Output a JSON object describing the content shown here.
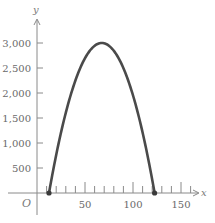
{
  "chart_data": {
    "type": "line",
    "title": "",
    "xlabel": "x",
    "ylabel": "y",
    "origin_label": "O",
    "xlim": [
      0,
      160
    ],
    "ylim": [
      0,
      3200
    ],
    "x_ticks": [
      50,
      100,
      150
    ],
    "x_minor_tick_step": 10,
    "y_ticks": [
      500,
      1000,
      1500,
      2000,
      2500,
      3000
    ],
    "y_tick_labels": [
      "500",
      "1,000",
      "1,500",
      "2,000",
      "2,500",
      "3,000"
    ],
    "grid": false,
    "legend": null,
    "series": [
      {
        "name": "parabola",
        "color": "#4a4a4a",
        "x": [
          12.5,
          20,
          30,
          40,
          50,
          60,
          67.5,
          75,
          85,
          95,
          105,
          115,
          122.5
        ],
        "y": [
          0,
          818,
          1727,
          2438,
          2950,
          3262,
          3000,
          2950,
          2698,
          2250,
          1612,
          785,
          0
        ]
      }
    ],
    "marked_points": [
      {
        "x": 12.5,
        "y": 0
      },
      {
        "x": 122.5,
        "y": 0
      }
    ],
    "vertex": {
      "x": 67.5,
      "y": 3000
    }
  }
}
